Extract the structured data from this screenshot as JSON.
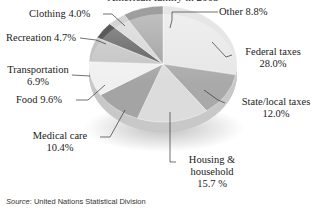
{
  "chart_data": {
    "type": "pie",
    "title": "American family in 2005",
    "categories": [
      "Federal taxes",
      "State/local taxes",
      "Housing & household",
      "Medical care",
      "Food",
      "Transportation",
      "Recreation",
      "Clothing",
      "Other"
    ],
    "values": [
      28.0,
      12.0,
      15.7,
      10.4,
      9.6,
      6.9,
      4.7,
      4.0,
      8.8
    ],
    "unit": "%",
    "style": "3D pie",
    "source": "United Nations Statistical Division"
  },
  "labels": {
    "title": "American family in 2005",
    "federal_name": "Federal taxes",
    "federal_value": "28.0%",
    "state_name": "State/local taxes",
    "state_value": "12.0%",
    "housing_name1": "Housing &",
    "housing_name2": "household",
    "housing_value": "15.7 %",
    "medical_name": "Medical care",
    "medical_value": "10.4%",
    "food": "Food 9.6%",
    "transport_name": "Transportation",
    "transport_value": "6.9%",
    "recreation": "Recreation 4.7%",
    "clothing": "Clothing 4.0%",
    "other": "Other 8.8%"
  },
  "source": {
    "prefix": "Source",
    "text": ": United Nations Statistical Division"
  },
  "colors": {
    "federal": "#e6e6e6",
    "state": "#a9a9a9",
    "housing": "#dcdcdc",
    "medical": "#a4a4a4",
    "food": "#f0f0f0",
    "transport": "#c2c2c2",
    "recreation": "#5a5a5a",
    "clothing": "#d4d4d4",
    "other": "#9e9e9e"
  }
}
